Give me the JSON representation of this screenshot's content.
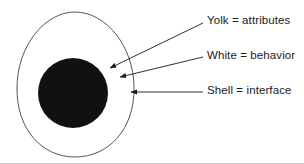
{
  "figure": {
    "name": "egg-analogy-diagram",
    "background_color": "#ffffff",
    "outline_color": "#55555a",
    "yolk_color": "#111111",
    "white_color": "#ffffff",
    "arrow_color": "#1a1a1a",
    "text_color": "#1a1a1a",
    "border_color": "#c8c8c8"
  },
  "shapes": {
    "shell": {
      "label": "egg-shell-outline",
      "cx": 75,
      "cy": 86,
      "rx": 58,
      "ry": 74,
      "top_y": 12,
      "bottom_y": 157,
      "left_x": 17,
      "right_x": 134
    },
    "white": {
      "label": "egg-white-region"
    },
    "yolk": {
      "label": "egg-yolk-circle",
      "cx": 73,
      "cy": 93,
      "r": 35
    }
  },
  "labels": [
    {
      "id": "yolk",
      "text": "Yolk = attributes",
      "text_x": 207,
      "text_y": 21,
      "line_from_x": 203,
      "line_from_y": 23,
      "line_to_x": 110,
      "line_to_y": 68,
      "arrow_target": "yolk-edge"
    },
    {
      "id": "white",
      "text": "White = behavior",
      "text_x": 207,
      "text_y": 56,
      "line_from_x": 203,
      "line_from_y": 57,
      "line_to_x": 120,
      "line_to_y": 77,
      "arrow_target": "egg-white"
    },
    {
      "id": "shell",
      "text": "Shell = interface",
      "text_x": 207,
      "text_y": 91,
      "line_from_x": 203,
      "line_from_y": 92,
      "line_to_x": 131,
      "line_to_y": 92,
      "arrow_target": "shell-outline"
    }
  ]
}
